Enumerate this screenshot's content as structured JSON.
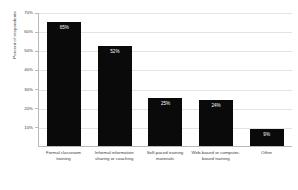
{
  "chart_data": {
    "type": "bar",
    "title": "",
    "xlabel": "",
    "ylabel": "Percent of respondents",
    "ylim": [
      0,
      70
    ],
    "grid": true,
    "legend": "none",
    "categories": [
      "Formal classroom training",
      "Informal information sharing or coaching",
      "Self-paced training materials",
      "Web-based or computer-based training",
      "Other"
    ],
    "values": [
      65,
      52,
      25,
      24,
      9
    ],
    "value_labels": [
      "65%",
      "52%",
      "25%",
      "24%",
      "9%"
    ],
    "ytick_labels": [
      "70%",
      "60%",
      "50%",
      "40%",
      "30%",
      "20%",
      "10%"
    ],
    "ytick_values": [
      70,
      60,
      50,
      40,
      30,
      20,
      10
    ],
    "bar_color": "#0a0a0a",
    "value_label_color": "#ffffff",
    "axis_color": "#b9b9b9",
    "gridline_color": "#e4e4e4",
    "background_color": "#ffffff"
  }
}
